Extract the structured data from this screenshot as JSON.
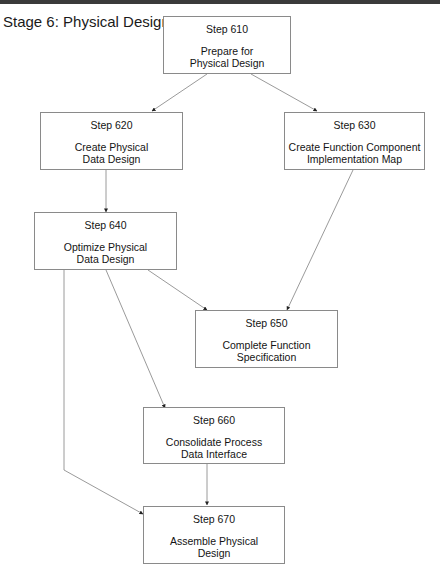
{
  "title": "Stage 6: Physical Design",
  "colors": {
    "box_border": "#8a8a8a",
    "edge": "#808080",
    "arrowhead": "#222222",
    "text": "#141414",
    "top_rule": "#3a3a3a"
  },
  "nodes": [
    {
      "id": "610",
      "step": "Step 610",
      "label": "Prepare for\nPhysical Design"
    },
    {
      "id": "620",
      "step": "Step 620",
      "label": "Create Physical\nData Design"
    },
    {
      "id": "630",
      "step": "Step 630",
      "label": "Create Function Component\nImplementation Map"
    },
    {
      "id": "640",
      "step": "Step 640",
      "label": "Optimize Physical\nData Design"
    },
    {
      "id": "650",
      "step": "Step 650",
      "label": "Complete Function\nSpecification"
    },
    {
      "id": "660",
      "step": "Step 660",
      "label": "Consolidate Process\nData Interface"
    },
    {
      "id": "670",
      "step": "Step 670",
      "label": "Assemble Physical\nDesign"
    }
  ],
  "edges": [
    {
      "from": "610",
      "to": "620"
    },
    {
      "from": "610",
      "to": "630"
    },
    {
      "from": "620",
      "to": "640"
    },
    {
      "from": "630",
      "to": "650"
    },
    {
      "from": "640",
      "to": "650"
    },
    {
      "from": "640",
      "to": "660"
    },
    {
      "from": "640",
      "to": "670"
    },
    {
      "from": "660",
      "to": "670"
    }
  ]
}
